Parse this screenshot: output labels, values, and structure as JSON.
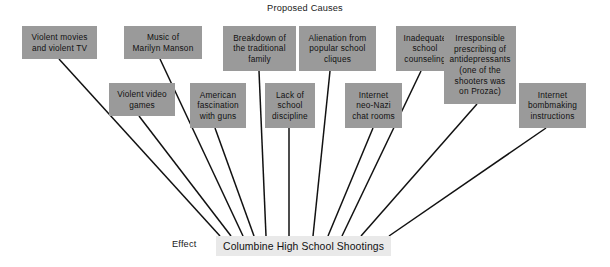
{
  "title": "Proposed Causes",
  "effect": {
    "label": "Effect",
    "text": "Columbine High School Shootings"
  },
  "colors": {
    "cause_box_fill": "#9a9a9a",
    "effect_box_fill": "#e9e9e9",
    "connector_line": "#111111",
    "background": "#ffffff",
    "text": "#111111"
  },
  "causes": [
    {
      "id": "violent-movies-tv",
      "lines": [
        "Violent movies",
        "and violent TV"
      ],
      "box": {
        "x": 22,
        "y": 26,
        "w": 75,
        "h": 33
      },
      "connector": {
        "x1": 59,
        "y1": 59,
        "x2": 220,
        "y2": 236
      }
    },
    {
      "id": "violent-video-games",
      "lines": [
        "Violent video",
        "games"
      ],
      "box": {
        "x": 109,
        "y": 83,
        "w": 66,
        "h": 33
      },
      "connector": {
        "x1": 139,
        "y1": 116,
        "x2": 231,
        "y2": 236
      }
    },
    {
      "id": "music-marilyn-manson",
      "lines": [
        "Music of",
        "Marilyn Manson"
      ],
      "box": {
        "x": 124,
        "y": 26,
        "w": 78,
        "h": 33
      },
      "connector": {
        "x1": 160,
        "y1": 59,
        "x2": 243,
        "y2": 236
      }
    },
    {
      "id": "american-fascination-guns",
      "lines": [
        "American",
        "fascination",
        "with guns"
      ],
      "box": {
        "x": 190,
        "y": 83,
        "w": 56,
        "h": 45
      },
      "connector": {
        "x1": 215,
        "y1": 128,
        "x2": 254,
        "y2": 236
      }
    },
    {
      "id": "breakdown-traditional-family",
      "lines": [
        "Breakdown of",
        "the traditional",
        "family"
      ],
      "box": {
        "x": 223,
        "y": 26,
        "w": 73,
        "h": 45
      },
      "connector": {
        "x1": 259,
        "y1": 71,
        "x2": 266,
        "y2": 236
      }
    },
    {
      "id": "lack-school-discipline",
      "lines": [
        "Lack of",
        "school",
        "discipline"
      ],
      "box": {
        "x": 265,
        "y": 83,
        "w": 50,
        "h": 45
      },
      "connector": {
        "x1": 289,
        "y1": 128,
        "x2": 289,
        "y2": 236
      }
    },
    {
      "id": "alienation-popular-cliques",
      "lines": [
        "Alienation from",
        "popular school",
        "cliques"
      ],
      "box": {
        "x": 299,
        "y": 26,
        "w": 77,
        "h": 45
      },
      "connector": {
        "x1": 330,
        "y1": 71,
        "x2": 313,
        "y2": 236
      }
    },
    {
      "id": "internet-neo-nazi-chat",
      "lines": [
        "Internet",
        "neo-Nazi",
        "chat rooms"
      ],
      "box": {
        "x": 345,
        "y": 83,
        "w": 57,
        "h": 45
      },
      "connector": {
        "x1": 373,
        "y1": 128,
        "x2": 328,
        "y2": 236
      }
    },
    {
      "id": "inadequate-school-counseling",
      "lines": [
        "Inadequate",
        "school",
        "counseling"
      ],
      "box": {
        "x": 396,
        "y": 26,
        "w": 58,
        "h": 45
      },
      "connector": {
        "x1": 421,
        "y1": 71,
        "x2": 342,
        "y2": 236
      }
    },
    {
      "id": "irresponsible-antidepressants",
      "lines": [
        "Irresponsible",
        "prescribing of",
        "antidepressants",
        "(one of the",
        "shooters was",
        "on Prozac)"
      ],
      "box": {
        "x": 444,
        "y": 26,
        "w": 72,
        "h": 78
      },
      "connector": {
        "x1": 477,
        "y1": 104,
        "x2": 361,
        "y2": 236
      }
    },
    {
      "id": "internet-bombmaking-instructions",
      "lines": [
        "Internet",
        "bombmaking",
        "instructions"
      ],
      "box": {
        "x": 519,
        "y": 83,
        "w": 67,
        "h": 45
      },
      "connector": {
        "x1": 546,
        "y1": 128,
        "x2": 389,
        "y2": 236
      }
    }
  ]
}
